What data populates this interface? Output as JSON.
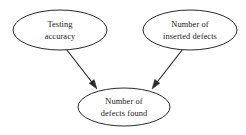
{
  "diagram": {
    "background_color": "#ffffff",
    "stroke_color": "#2b2b2b",
    "text_color": "#1a1a1a",
    "nodes": [
      {
        "id": "testing-accuracy",
        "line1": "Testing",
        "line2": "accuracy",
        "shape": "ellipse",
        "cx": 60,
        "cy": 30,
        "rx": 47,
        "ry": 20
      },
      {
        "id": "inserted-defects",
        "line1": "Number of",
        "line2": "inserted defects",
        "shape": "ellipse",
        "cx": 190,
        "cy": 30,
        "rx": 47,
        "ry": 20
      },
      {
        "id": "defects-found",
        "line1": "Number of",
        "line2": "defects found",
        "shape": "ellipse",
        "cx": 124,
        "cy": 107,
        "rx": 46,
        "ry": 19
      }
    ],
    "edges": [
      {
        "id": "edge-accuracy-to-found",
        "from": "testing-accuracy",
        "to": "defects-found",
        "x1": 63,
        "y1": 45,
        "x2": 97,
        "y2": 89,
        "arrowhead": "solid-triangle"
      },
      {
        "id": "edge-inserted-to-found",
        "from": "inserted-defects",
        "to": "defects-found",
        "x1": 186,
        "y1": 45,
        "x2": 152,
        "y2": 89,
        "arrowhead": "solid-triangle"
      }
    ]
  }
}
